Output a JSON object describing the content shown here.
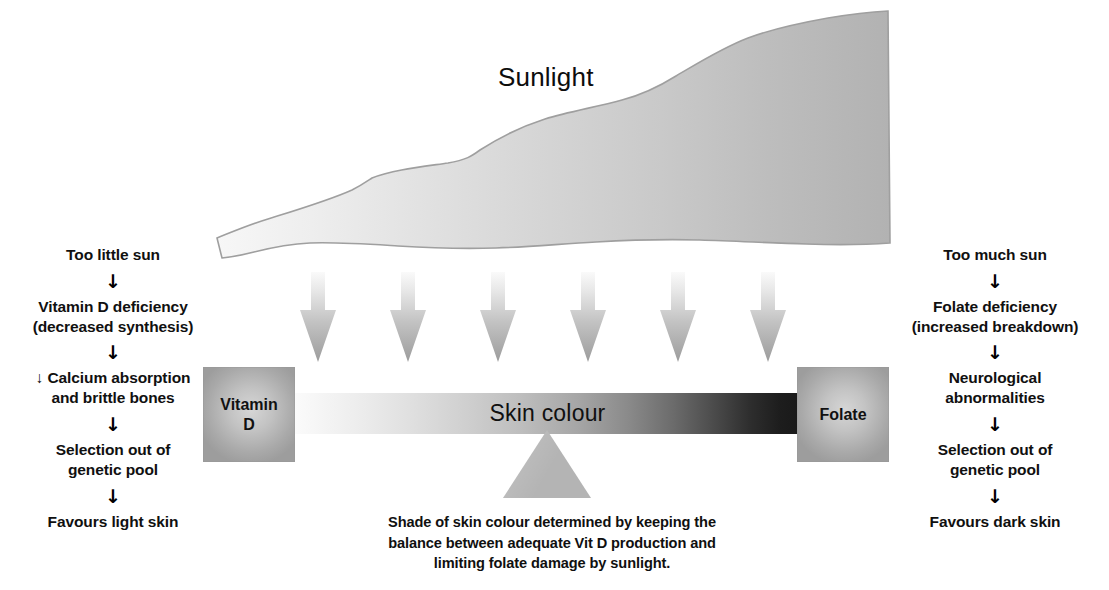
{
  "diagram": {
    "title_label": "Sunlight",
    "balance": {
      "left_box_label": "Vitamin\nD",
      "right_box_label": "Folate",
      "bar_label": "Skin colour",
      "bar_gradient_from": "#fbfbfb",
      "bar_gradient_to": "#191919",
      "fulcrum_color": "#b4b4b4"
    },
    "caption": "Shade of skin colour determined by keeping the\nbalance between adequate Vit D production and\nlimiting folate damage by sunlight.",
    "rays": {
      "count": 6,
      "color_top": "#f2f2f2",
      "color_bottom": "#9a9a9a"
    },
    "left_chain": {
      "name": "too-little-sun-chain",
      "steps": [
        "Too little sun",
        "Vitamin D deficiency\n(decreased synthesis)",
        "↓ Calcium absorption\nand brittle bones",
        "Selection out of\ngenetic pool",
        "Favours light skin"
      ],
      "arrow": "↓"
    },
    "right_chain": {
      "name": "too-much-sun-chain",
      "steps": [
        "Too much sun",
        "Folate deficiency\n(increased breakdown)",
        "Neurological\nabnormalities",
        "Selection out of\ngenetic pool",
        "Favours dark skin"
      ],
      "arrow": "↓"
    }
  }
}
